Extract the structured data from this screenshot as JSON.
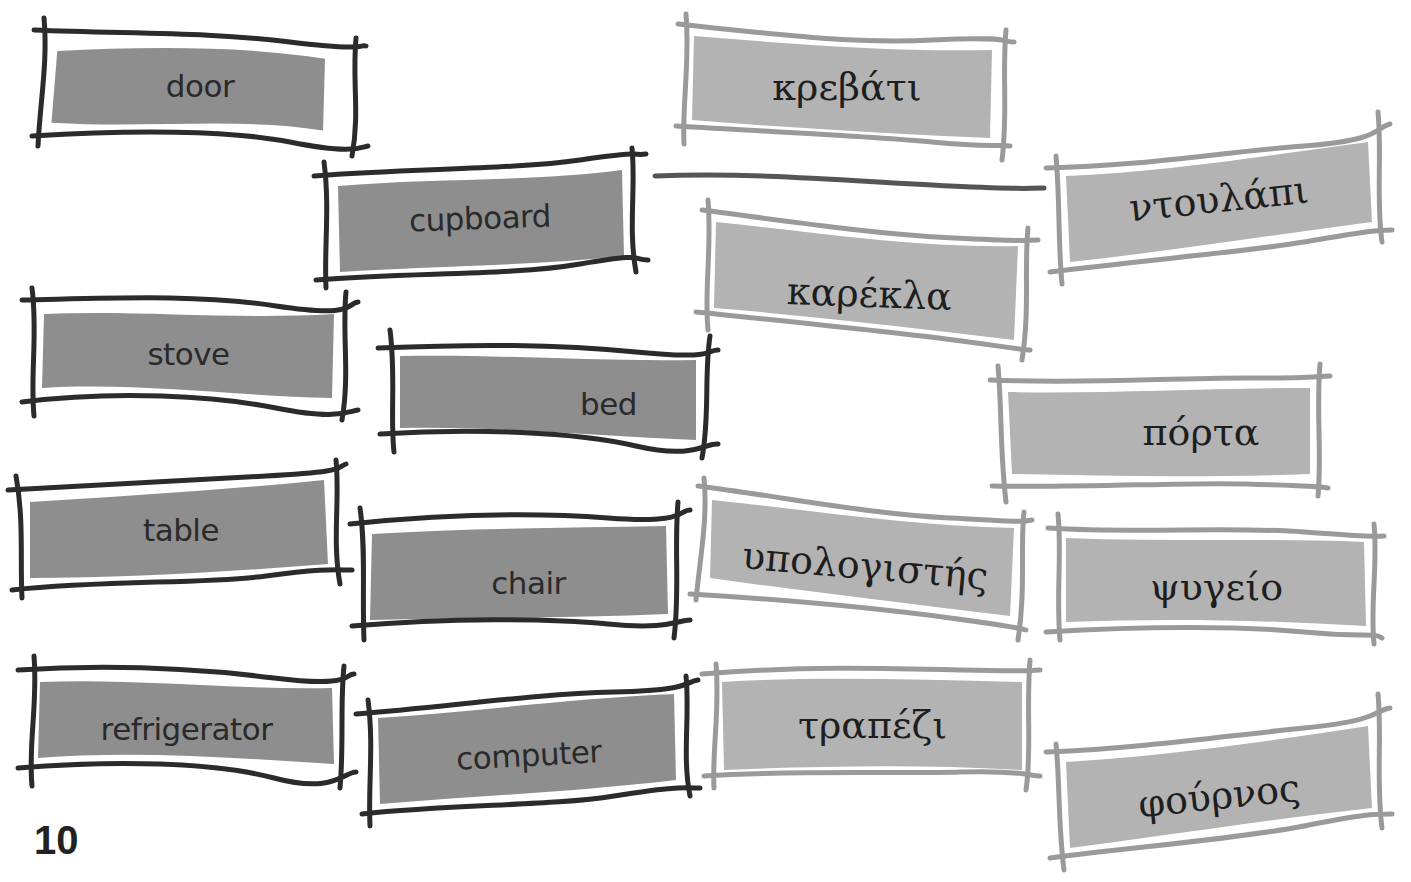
{
  "page": {
    "page_number": "10",
    "colors": {
      "english_frame": "#2b2b2b",
      "english_fill": "#8e8e8e",
      "greek_frame": "#9a9a9a",
      "greek_fill": "#b3b3b3",
      "match_line": "#555555",
      "background": "#ffffff"
    }
  },
  "english_words": [
    {
      "id": "door",
      "label": "door"
    },
    {
      "id": "cupboard",
      "label": "cupboard"
    },
    {
      "id": "stove",
      "label": "stove"
    },
    {
      "id": "bed",
      "label": "bed"
    },
    {
      "id": "table",
      "label": "table"
    },
    {
      "id": "chair",
      "label": "chair"
    },
    {
      "id": "refrigerator",
      "label": "refrigerator"
    },
    {
      "id": "computer",
      "label": "computer"
    }
  ],
  "greek_words": [
    {
      "id": "krevati",
      "label": "κρεβάτι"
    },
    {
      "id": "ntoulapi",
      "label": "ντουλάπι"
    },
    {
      "id": "karekla",
      "label": "καρέκλα"
    },
    {
      "id": "porta",
      "label": "πόρτα"
    },
    {
      "id": "ypologistis",
      "label": "υπολογιστής"
    },
    {
      "id": "psygeio",
      "label": "ψυγείο"
    },
    {
      "id": "trapezi",
      "label": "τραπέζι"
    },
    {
      "id": "fournos",
      "label": "φούρνος"
    }
  ],
  "matches": [
    {
      "from": "cupboard",
      "to": "ntoulapi"
    }
  ]
}
